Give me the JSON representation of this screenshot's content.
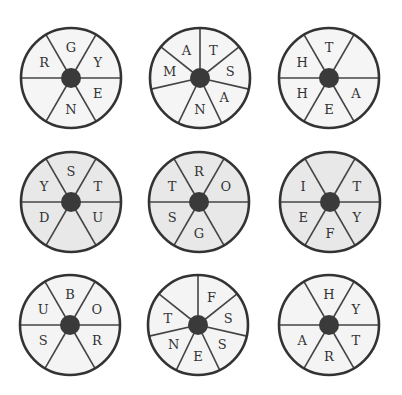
{
  "puzzle": {
    "wheels": [
      {
        "id": 1,
        "cx": 71,
        "cy": 78,
        "r": 50,
        "fill": "#f5f5f5",
        "segments": 6,
        "start_angle": -30,
        "letters": [
          "G",
          "Y",
          "E",
          "N",
          "",
          "R"
        ]
      },
      {
        "id": 2,
        "cx": 200,
        "cy": 78,
        "r": 50,
        "fill": "#f5f5f5",
        "segments": 7,
        "start_angle": 0,
        "letters": [
          "T",
          "S",
          "A",
          "N",
          "",
          "M",
          "A"
        ]
      },
      {
        "id": 3,
        "cx": 329,
        "cy": 78,
        "r": 50,
        "fill": "#f5f5f5",
        "segments": 6,
        "start_angle": -30,
        "letters": [
          "T",
          "",
          "A",
          "E",
          "H",
          "H"
        ]
      },
      {
        "id": 4,
        "cx": 71,
        "cy": 202,
        "r": 50,
        "fill": "#e8e8e8",
        "segments": 6,
        "start_angle": -30,
        "letters": [
          "S",
          "T",
          "U",
          "",
          "D",
          "Y"
        ]
      },
      {
        "id": 5,
        "cx": 199,
        "cy": 202,
        "r": 50,
        "fill": "#e8e8e8",
        "segments": 6,
        "start_angle": -30,
        "letters": [
          "R",
          "O",
          "",
          "G",
          "S",
          "T"
        ]
      },
      {
        "id": 6,
        "cx": 330,
        "cy": 202,
        "r": 50,
        "fill": "#e8e8e8",
        "segments": 6,
        "start_angle": -30,
        "letters": [
          "",
          "T",
          "Y",
          "F",
          "E",
          "I"
        ]
      },
      {
        "id": 7,
        "cx": 70,
        "cy": 325,
        "r": 50,
        "fill": "#f4f4f4",
        "segments": 6,
        "start_angle": -30,
        "letters": [
          "B",
          "O",
          "R",
          "",
          "S",
          "U"
        ]
      },
      {
        "id": 8,
        "cx": 198,
        "cy": 325,
        "r": 50,
        "fill": "#f4f4f4",
        "segments": 7,
        "start_angle": 0,
        "letters": [
          "F",
          "S",
          "S",
          "E",
          "N",
          "T",
          ""
        ]
      },
      {
        "id": 9,
        "cx": 329,
        "cy": 325,
        "r": 50,
        "fill": "#f4f4f4",
        "segments": 6,
        "start_angle": -30,
        "letters": [
          "H",
          "Y",
          "T",
          "R",
          "A",
          ""
        ]
      }
    ],
    "colors": {
      "outline": "#333333",
      "hub": "#3a3a3a",
      "divider": "#444444",
      "letter": "#333333"
    }
  }
}
